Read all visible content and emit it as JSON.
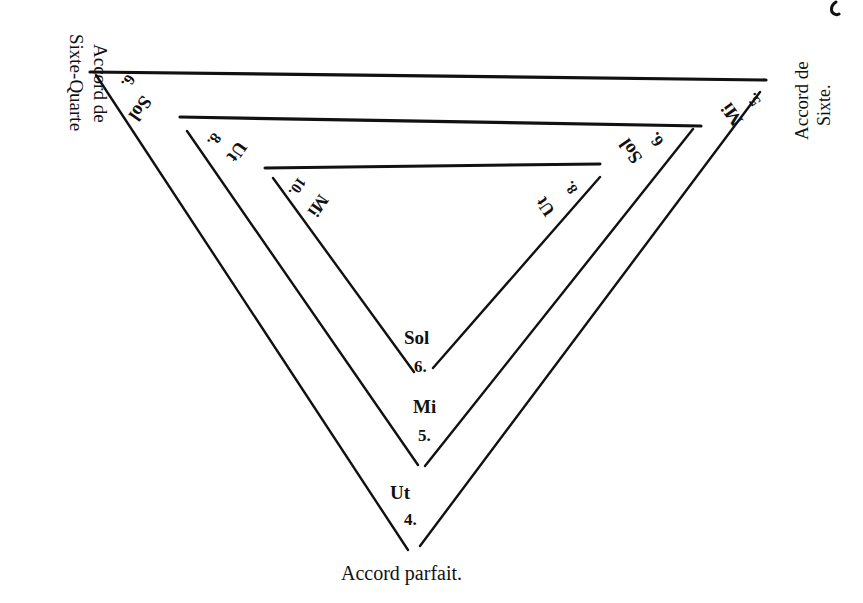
{
  "diagram": {
    "type": "nested-triangles",
    "vertex_labels": {
      "top_left": {
        "line1": "Accord de",
        "line2": "Sixte-Quarte"
      },
      "top_right": {
        "line1": "Accord de",
        "line2": "Sixte."
      },
      "bottom": "Accord parfait."
    },
    "triangles": [
      {
        "name": "outer",
        "left_corner": {
          "note": "Sol",
          "number": "6."
        },
        "right_corner": {
          "note": "Mi",
          "number": "5."
        },
        "bottom_corner": {
          "note": "Ut",
          "number": "4."
        }
      },
      {
        "name": "middle",
        "left_corner": {
          "note": "Ut",
          "number": "8."
        },
        "right_corner": {
          "note": "Sol",
          "number": "6."
        },
        "bottom_corner": {
          "note": "Mi",
          "number": "5."
        }
      },
      {
        "name": "inner",
        "left_corner": {
          "note": "Mi",
          "number": "10."
        },
        "right_corner": {
          "note": "Ut",
          "number": "8."
        },
        "bottom_corner": {
          "note": "Sol",
          "number": "6."
        }
      }
    ]
  },
  "colors": {
    "ink": "#111111",
    "paper": "#ffffff"
  }
}
